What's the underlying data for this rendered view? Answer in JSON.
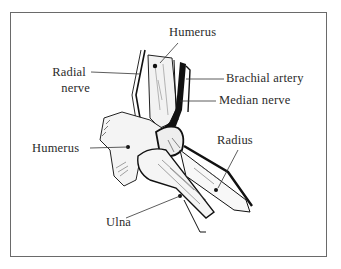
{
  "figure": {
    "type": "anatomical-illustration",
    "labels": {
      "humerus_top": "Humerus",
      "radial_nerve_line1": "Radial",
      "radial_nerve_line2": "nerve",
      "brachial_artery": "Brachial artery",
      "median_nerve": "Median nerve",
      "humerus_left": "Humerus",
      "radius": "Radius",
      "ulna": "Ulna"
    },
    "colors": {
      "ink": "#1a1a1a",
      "frame": "#6a6a6a",
      "background": "#ffffff"
    }
  }
}
